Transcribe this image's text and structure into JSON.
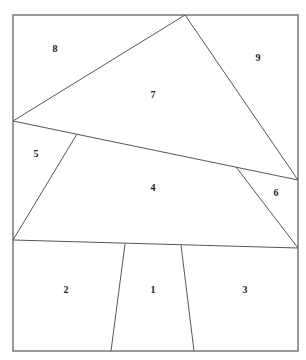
{
  "diagram": {
    "frame": {
      "x": 13,
      "y": 15,
      "width": 285,
      "height": 336,
      "color": "#777777"
    },
    "edge_color": "#555555",
    "edges": [
      {
        "id": "apex-left",
        "x1": 185,
        "y1": 15,
        "x2": 13,
        "y2": 121
      },
      {
        "id": "apex-right",
        "x1": 185,
        "y1": 15,
        "x2": 298,
        "y2": 180
      },
      {
        "id": "crown-base",
        "x1": 13,
        "y1": 121,
        "x2": 298,
        "y2": 180
      },
      {
        "id": "left-slope",
        "x1": 77,
        "y1": 134,
        "x2": 13,
        "y2": 240
      },
      {
        "id": "right-slope",
        "x1": 236,
        "y1": 167,
        "x2": 298,
        "y2": 248
      },
      {
        "id": "canopy-base",
        "x1": 13,
        "y1": 240,
        "x2": 298,
        "y2": 248
      },
      {
        "id": "trunk-left",
        "x1": 125,
        "y1": 244,
        "x2": 111,
        "y2": 351
      },
      {
        "id": "trunk-right",
        "x1": 181,
        "y1": 245,
        "x2": 194,
        "y2": 351
      }
    ],
    "regions": [
      {
        "id": "1",
        "label": "1",
        "x": 153,
        "y": 291
      },
      {
        "id": "2",
        "label": "2",
        "x": 66,
        "y": 291
      },
      {
        "id": "3",
        "label": "3",
        "x": 245,
        "y": 291
      },
      {
        "id": "4",
        "label": "4",
        "x": 153,
        "y": 189
      },
      {
        "id": "5",
        "label": "5",
        "x": 36,
        "y": 155
      },
      {
        "id": "6",
        "label": "6",
        "x": 276,
        "y": 194
      },
      {
        "id": "7",
        "label": "7",
        "x": 153,
        "y": 96
      },
      {
        "id": "8",
        "label": "8",
        "x": 55,
        "y": 50
      },
      {
        "id": "9",
        "label": "9",
        "x": 258,
        "y": 59
      }
    ]
  }
}
